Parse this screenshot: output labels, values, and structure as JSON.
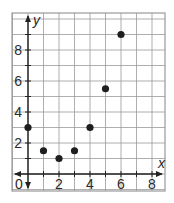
{
  "chart_data": {
    "type": "scatter",
    "title": "",
    "xlabel": "x",
    "ylabel": "y",
    "x": [
      0,
      1,
      2,
      3,
      4,
      5,
      6
    ],
    "series": [
      {
        "name": "points",
        "values": [
          3,
          1.5,
          1,
          1.5,
          3,
          5.5,
          9
        ]
      }
    ],
    "xlim": [
      -0.5,
      9
    ],
    "ylim": [
      -1,
      10
    ],
    "xticks": [
      2,
      4,
      6,
      8
    ],
    "yticks": [
      2,
      4,
      6,
      8
    ],
    "origin_label": "0",
    "grid": true,
    "grid_step": 1,
    "legend": "none",
    "colors": {
      "grid": "#9a9a9a",
      "axis": "#222222",
      "point": "#1e1e1e",
      "frame": "#9a9a9a"
    }
  }
}
